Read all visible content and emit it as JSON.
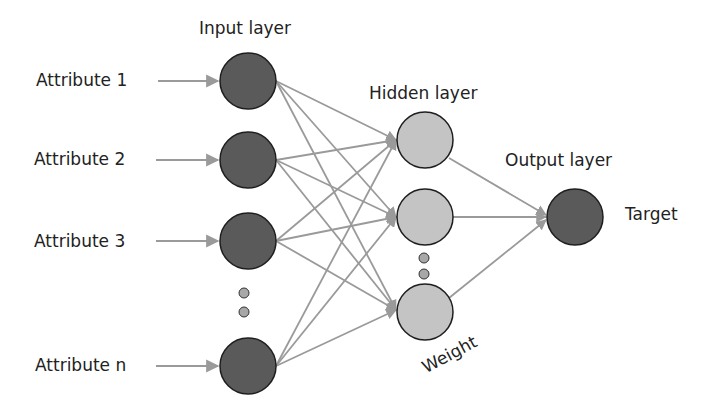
{
  "diagram": {
    "type": "neural-network",
    "layers": {
      "input": {
        "title": "Input layer",
        "node_color": "#5a5a5a"
      },
      "hidden": {
        "title": "Hidden layer",
        "node_color": "#c4c4c4"
      },
      "output": {
        "title": "Output layer",
        "node_color": "#5a5a5a"
      }
    },
    "attributes": [
      {
        "label": "Attribute 1"
      },
      {
        "label": "Attribute 2"
      },
      {
        "label": "Attribute 3"
      },
      {
        "label": "Attribute n"
      }
    ],
    "target_label": "Target",
    "weight_label": "Weight",
    "colors": {
      "edge": "#9a9a9a",
      "node_stroke": "#1e1e1e",
      "ellipsis_dot": "#a8a8a8"
    }
  }
}
